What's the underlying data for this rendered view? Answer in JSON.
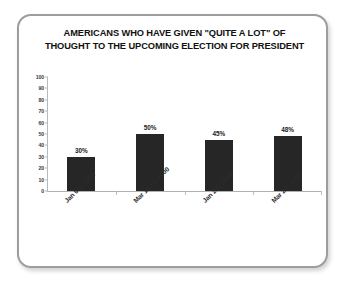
{
  "card": {
    "border_color": "#9d9d9d",
    "background": "#ffffff"
  },
  "chart_data": {
    "type": "bar",
    "title": "AMERICANS WHO HAVE GIVEN \"QUITE A LOT\" OF THOUGHT TO THE UPCOMING ELECTION FOR PRESIDENT",
    "title_lines": [
      "AMERICANS WHO HAVE GIVEN \"QUITE A LOT\" OF",
      "THOUGHT TO THE UPCOMING ELECTION FOR PRESIDENT"
    ],
    "categories": [
      "Jan 6-9, 1992",
      "Mar 10-12, 2000",
      "Jan 2-5, 2004",
      "Mar 2-4, 2007"
    ],
    "values": [
      30,
      50,
      45,
      48
    ],
    "data_labels": [
      "30%",
      "50%",
      "45%",
      "48%"
    ],
    "xlabel": "",
    "ylabel": "",
    "ylim": [
      0,
      100
    ],
    "ytick_step": 10,
    "yticks": [
      0,
      10,
      20,
      30,
      40,
      50,
      60,
      70,
      80,
      90,
      100
    ],
    "ytick_labels": [
      "0",
      "10",
      "20",
      "30",
      "40",
      "50",
      "60",
      "70",
      "80",
      "90",
      "100"
    ],
    "grid": false,
    "legend": false,
    "bar_color": "#262626",
    "axis_color": "#b0b0b0",
    "label_rotation": -45
  }
}
